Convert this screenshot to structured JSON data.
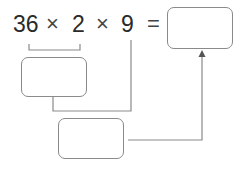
{
  "expression": {
    "operand_1": "36",
    "operator_1": "×",
    "operand_2": "2",
    "operator_2": "×",
    "operand_3": "9",
    "equals": "="
  },
  "boxes": {
    "answer_box": "",
    "partial_product_box": "",
    "second_step_box": ""
  },
  "colors": {
    "text": "#2a2a2a",
    "line": "#8a8a8a"
  }
}
